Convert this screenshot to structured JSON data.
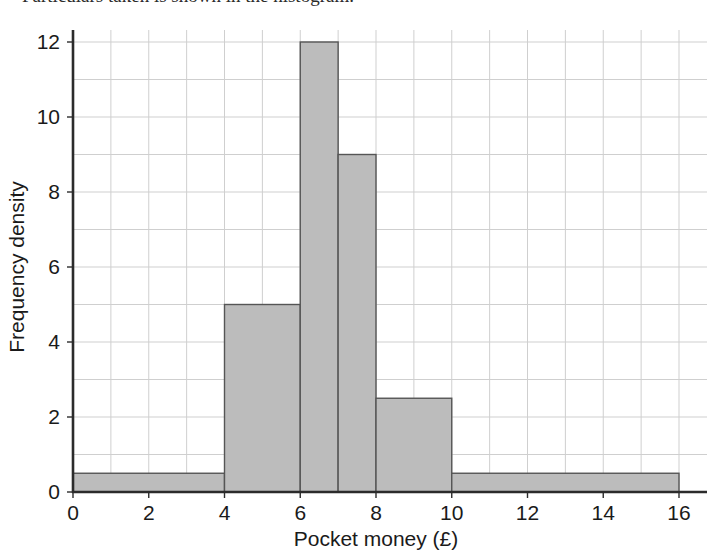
{
  "figure": {
    "top_text_fragment": "Particulars taken is shown in the histogram.",
    "background_color": "#ffffff"
  },
  "chart_data": {
    "type": "bar",
    "chart_subtype": "histogram",
    "title": "",
    "xlabel": "Pocket money (£)",
    "ylabel": "Frequency density",
    "xlim": [
      0,
      16
    ],
    "ylim": [
      0,
      12
    ],
    "xticks": [
      0,
      2,
      4,
      6,
      8,
      10,
      12,
      14,
      16
    ],
    "xtick_labels": [
      "0",
      "2",
      "4",
      "6",
      "8",
      "10",
      "12",
      "14",
      "16"
    ],
    "yticks": [
      0,
      2,
      4,
      6,
      8,
      10,
      12
    ],
    "ytick_labels": [
      "0",
      "2",
      "4",
      "6",
      "8",
      "10",
      "12"
    ],
    "grid": true,
    "grid_x_step": 1,
    "grid_y_step": 1,
    "legend": false,
    "bar_fill_color": "#bcbcbc",
    "bar_edge_color": "#555555",
    "grid_color": "#cfcfcf",
    "axis_color": "#2b2b2b",
    "bins": [
      {
        "x_start": 0,
        "x_end": 4,
        "value": 0.5,
        "frequency": 2
      },
      {
        "x_start": 4,
        "x_end": 6,
        "value": 5,
        "frequency": 10
      },
      {
        "x_start": 6,
        "x_end": 7,
        "value": 12,
        "frequency": 12
      },
      {
        "x_start": 7,
        "x_end": 8,
        "value": 9,
        "frequency": 9
      },
      {
        "x_start": 8,
        "x_end": 10,
        "value": 2.5,
        "frequency": 5
      },
      {
        "x_start": 10,
        "x_end": 16,
        "value": 0.5,
        "frequency": 3
      }
    ],
    "categories": [
      "0-4",
      "4-6",
      "6-7",
      "7-8",
      "8-10",
      "10-16"
    ],
    "values": [
      0.5,
      5,
      12,
      9,
      2.5,
      0.5
    ]
  }
}
